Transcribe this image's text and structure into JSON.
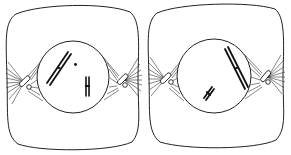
{
  "figure": {
    "description": "Two animal cells in prophase of cell division, each with a central nucleus, paired centrioles with radiating asters at opposite poles, and condensed chromosomes",
    "colors": {
      "line": "#222222",
      "background": "#ffffff"
    },
    "cells": [
      {
        "id": "cell-1",
        "label": "Cell 1",
        "nucleus": {
          "cx": 73,
          "cy": 77,
          "r": 36
        },
        "centrioles": [
          {
            "x": 25,
            "y": 82,
            "side": "left"
          },
          {
            "x": 124,
            "y": 82,
            "side": "right"
          }
        ],
        "chromosomes": [
          {
            "type": "large-X",
            "from": [
              48,
              84
            ],
            "to": [
              70,
              53
            ]
          },
          {
            "type": "dot",
            "at": [
              75,
              65
            ]
          },
          {
            "type": "small",
            "from": [
              87,
              77
            ],
            "to": [
              87,
              96
            ]
          }
        ]
      },
      {
        "id": "cell-2",
        "label": "Cell 2",
        "nucleus": {
          "cx": 214,
          "cy": 76,
          "r": 37
        },
        "centrioles": [
          {
            "x": 166,
            "y": 79,
            "side": "left"
          },
          {
            "x": 268,
            "y": 77,
            "side": "right"
          }
        ],
        "chromosomes": [
          {
            "type": "large-X",
            "from": [
              226,
              48
            ],
            "to": [
              247,
              88
            ]
          },
          {
            "type": "small-X",
            "from": [
              205,
              100
            ],
            "to": [
              213,
              88
            ]
          }
        ]
      }
    ]
  }
}
